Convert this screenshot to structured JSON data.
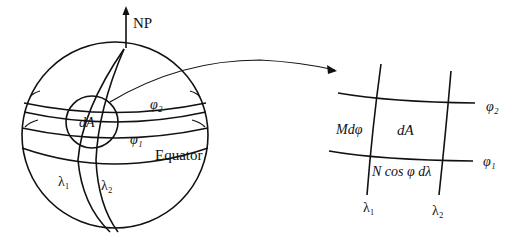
{
  "diagram": {
    "type": "ellipsoid surface area element",
    "left": {
      "pole_label": "NP",
      "area_label": "dA",
      "parallel_upper": "φ₂",
      "parallel_lower": "φ₁",
      "equator_label": "Equator",
      "meridian_left": "λ₁",
      "meridian_right": "λ₂"
    },
    "right": {
      "area_label": "dA",
      "side_label": "Mdφ",
      "bottom_label": "N cos φ dλ",
      "parallel_upper": "φ₂",
      "parallel_lower": "φ₁",
      "meridian_left": "λ₁",
      "meridian_right": "λ₂"
    },
    "colors": {
      "stroke": "#111111",
      "background": "#ffffff"
    }
  }
}
